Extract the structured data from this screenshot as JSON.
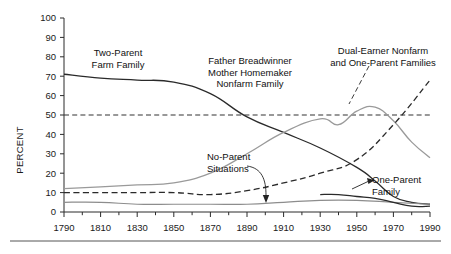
{
  "chart_data": {
    "type": "line",
    "title": "",
    "xlabel": "",
    "ylabel": "PERCENT",
    "xlim": [
      1790,
      1990
    ],
    "ylim": [
      0,
      100
    ],
    "grid": false,
    "legend": "annotations-on-plot",
    "x_ticks_major": [
      1790,
      1810,
      1830,
      1850,
      1870,
      1890,
      1910,
      1930,
      1950,
      1970,
      1990
    ],
    "x_ticks_minor": [
      1800,
      1820,
      1840,
      1860,
      1880,
      1900,
      1920,
      1940,
      1960,
      1980
    ],
    "y_ticks": [
      0,
      10,
      20,
      30,
      40,
      50,
      60,
      70,
      80,
      90,
      100
    ],
    "reference_line": {
      "label": "50 percent reference",
      "y": 50,
      "style": "dashed",
      "color": "#333333"
    },
    "series": [
      {
        "name": "Two-Parent Farm Family",
        "style": "solid",
        "color": "#2a2a2a",
        "width": 1.3,
        "x": [
          1790,
          1810,
          1830,
          1850,
          1870,
          1890,
          1910,
          1930,
          1950,
          1960,
          1970,
          1980,
          1990
        ],
        "values": [
          71,
          69,
          68,
          67,
          61,
          49,
          41,
          33,
          23,
          16,
          8,
          5,
          4
        ]
      },
      {
        "name": "Father Breadwinner Mother Homemaker Nonfarm Family",
        "style": "solid",
        "color": "#9a9a9a",
        "width": 1.3,
        "x": [
          1790,
          1810,
          1830,
          1850,
          1870,
          1890,
          1910,
          1930,
          1940,
          1950,
          1960,
          1970,
          1980,
          1990
        ],
        "values": [
          12,
          13,
          14,
          15,
          20,
          30,
          41,
          48,
          45,
          52,
          54,
          47,
          36,
          28
        ]
      },
      {
        "name": "Dual-Earner Nonfarm and One-Parent Families",
        "style": "dashed",
        "color": "#2a2a2a",
        "width": 1.3,
        "x": [
          1790,
          1810,
          1830,
          1850,
          1870,
          1890,
          1910,
          1930,
          1950,
          1970,
          1990
        ],
        "values": [
          10,
          10,
          10,
          10,
          9,
          11,
          15,
          20,
          27,
          45,
          68
        ]
      },
      {
        "name": "No-Parent Situations",
        "style": "solid",
        "color": "#8d8d8d",
        "width": 1.2,
        "x": [
          1790,
          1810,
          1830,
          1850,
          1870,
          1890,
          1910,
          1930,
          1950,
          1970,
          1990
        ],
        "values": [
          5,
          5,
          4,
          4,
          4,
          4,
          5,
          6,
          6,
          5,
          4
        ]
      },
      {
        "name": "One-Parent Family",
        "style": "solid",
        "color": "#2a2a2a",
        "width": 1.3,
        "x": [
          1930,
          1940,
          1950,
          1960,
          1970,
          1980,
          1990
        ],
        "values": [
          9,
          9,
          8,
          7,
          5,
          3,
          3
        ]
      }
    ],
    "annotations": [
      {
        "id": "two-parent-farm",
        "text_lines": [
          "Two-Parent",
          "Farm Family"
        ],
        "x": 118,
        "y": 56,
        "anchor": "middle"
      },
      {
        "id": "father-breadwinner",
        "text_lines": [
          "Father Breadwinner",
          "Mother Homemaker",
          "Nonfarm Family"
        ],
        "x": 250,
        "y": 64,
        "anchor": "middle"
      },
      {
        "id": "dual-earner",
        "text_lines": [
          "Dual-Earner Nonfarm",
          "and One-Parent Families"
        ],
        "x": 383,
        "y": 54,
        "anchor": "middle"
      },
      {
        "id": "no-parent",
        "text_lines": [
          "No-Parent",
          "Situations"
        ],
        "x": 207,
        "y": 160,
        "anchor": "start"
      },
      {
        "id": "one-parent",
        "text_lines": [
          "One-Parent",
          "Family"
        ],
        "x": 372,
        "y": 183,
        "anchor": "start"
      }
    ]
  },
  "axis": {
    "y_label": "PERCENT",
    "y_tick_labels": [
      "100",
      "90",
      "80",
      "70",
      "60",
      "50",
      "40",
      "30",
      "20",
      "10",
      "0"
    ],
    "x_tick_labels": [
      "1790",
      "1810",
      "1830",
      "1850",
      "1870",
      "1890",
      "1910",
      "1930",
      "1950",
      "1970",
      "1990"
    ]
  },
  "annotation_text": {
    "two_parent_farm_1": "Two-Parent",
    "two_parent_farm_2": "Farm Family",
    "father_breadwinner_1": "Father Breadwinner",
    "father_breadwinner_2": "Mother Homemaker",
    "father_breadwinner_3": "Nonfarm Family",
    "dual_earner_1": "Dual-Earner Nonfarm",
    "dual_earner_2": "and One-Parent Families",
    "no_parent_1": "No-Parent",
    "no_parent_2": "Situations",
    "one_parent_1": "One-Parent",
    "one_parent_2": "Family"
  }
}
